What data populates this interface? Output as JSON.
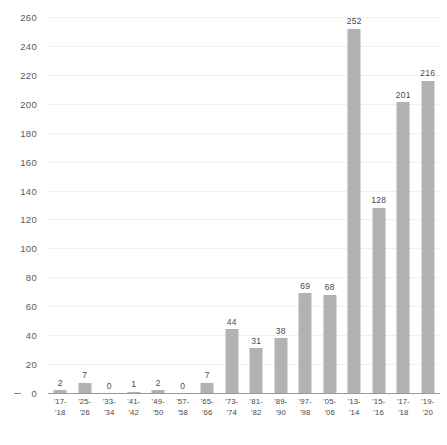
{
  "chart_data": {
    "type": "bar",
    "title": "",
    "subtitle": "",
    "xlabel": "",
    "ylabel": "",
    "ylim": [
      0,
      260
    ],
    "ytick_step": 20,
    "grid": true,
    "legend": false,
    "bar_color": "#b2b2b2",
    "grid_color": "#f0f0f0",
    "axis_color": "#9a9a9a",
    "label_color": "#4a4a4a",
    "categories": [
      "'17-'18",
      "'25-'26",
      "'33-'34",
      "'41-'42",
      "'49-'50",
      "'57-'58",
      "'65-'66",
      "'73-'74",
      "'81-'82",
      "'89-'90",
      "'97-'98",
      "'05-'06",
      "'13-'14",
      "'15-'16",
      "'17-'18",
      "'19-'20"
    ],
    "category_lines": [
      [
        "'17-",
        "'18"
      ],
      [
        "'25-",
        "'26"
      ],
      [
        "'33-",
        "'34"
      ],
      [
        "'41-",
        "'42"
      ],
      [
        "'49-",
        "'50"
      ],
      [
        "'57-",
        "'58"
      ],
      [
        "'65-",
        "'66"
      ],
      [
        "'73-",
        "'74"
      ],
      [
        "'81-",
        "'82"
      ],
      [
        "'89-",
        "'90"
      ],
      [
        "'97-",
        "'98"
      ],
      [
        "'05-",
        "'06"
      ],
      [
        "'13-",
        "'14"
      ],
      [
        "'15-",
        "'16"
      ],
      [
        "'17-",
        "'18"
      ],
      [
        "'19-",
        "'20"
      ]
    ],
    "values": [
      2,
      7,
      0,
      1,
      2,
      0,
      7,
      44,
      31,
      38,
      69,
      68,
      252,
      128,
      201,
      216
    ],
    "value_labels": [
      "2",
      "7",
      "0",
      "1",
      "2",
      "0",
      "7",
      "44",
      "31",
      "38",
      "69",
      "68",
      "252",
      "128",
      "201",
      "216"
    ],
    "ytick_labels": [
      "0",
      "20",
      "40",
      "60",
      "80",
      "100",
      "120",
      "140",
      "160",
      "180",
      "200",
      "220",
      "240",
      "260"
    ],
    "ytick_values": [
      0,
      20,
      40,
      60,
      80,
      100,
      120,
      140,
      160,
      180,
      200,
      220,
      240,
      260
    ]
  }
}
